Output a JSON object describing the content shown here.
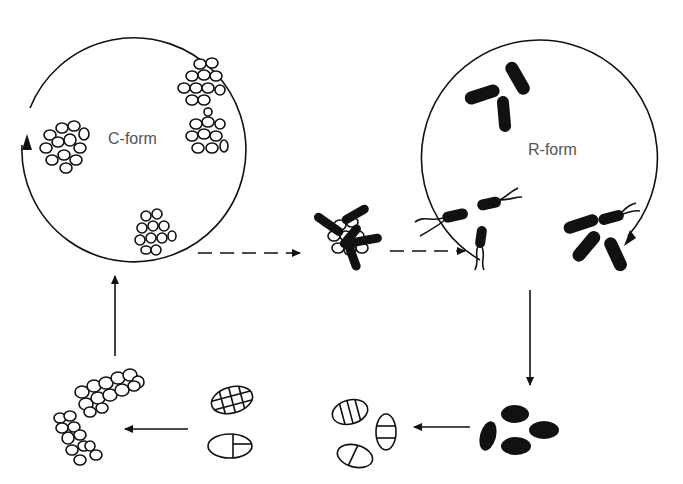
{
  "diagram": {
    "type": "life-cycle",
    "labels": {
      "c_form": "C-form",
      "r_form": "R-form"
    },
    "colors": {
      "ink": "#111111",
      "label": "#555555",
      "background": "#ffffff"
    },
    "stages": [
      {
        "id": "c-form-culture",
        "description": "Circle containing clusters of coccoid cells"
      },
      {
        "id": "transition-cluster",
        "description": "Cocci cluster with emerging rod cells"
      },
      {
        "id": "r-form-culture",
        "description": "Circle containing rod-shaped cells, some flagellated"
      },
      {
        "id": "ovoid-dark-cells",
        "description": "Dark ovoid cells"
      },
      {
        "id": "septate-cells",
        "description": "Ovoid cells with transverse septa"
      },
      {
        "id": "muriform-cells",
        "description": "Ovoid cells with cross-septa"
      },
      {
        "id": "cocci-chains",
        "description": "Elongated coccoid aggregates"
      }
    ],
    "arrows": [
      {
        "from": "c-form-culture",
        "to": "transition-cluster",
        "style": "dashed"
      },
      {
        "from": "transition-cluster",
        "to": "r-form-culture",
        "style": "dashed"
      },
      {
        "from": "r-form-culture",
        "to": "ovoid-dark-cells",
        "style": "solid"
      },
      {
        "from": "ovoid-dark-cells",
        "to": "septate-cells",
        "style": "solid"
      },
      {
        "from": "muriform-cells",
        "to": "cocci-chains",
        "style": "solid"
      },
      {
        "from": "cocci-chains",
        "to": "c-form-culture",
        "style": "solid"
      }
    ]
  }
}
